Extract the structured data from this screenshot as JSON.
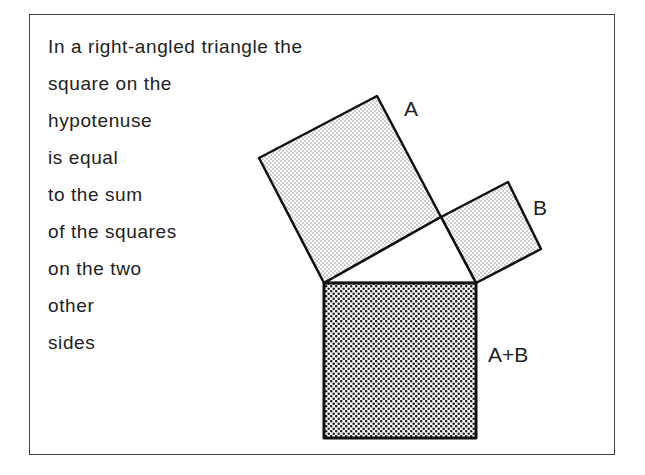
{
  "caption": {
    "lines": [
      "In a right-angled triangle the",
      "square on the",
      "hypotenuse",
      "is equal",
      "to the sum",
      "of the squares",
      "on the two",
      "other",
      "sides"
    ]
  },
  "labels": {
    "square_a": "A",
    "square_b": "B",
    "square_hyp": "A+B"
  },
  "colors": {
    "stroke": "#111111",
    "light_fill": "#d8d8d8",
    "dark_fill": "#5a5a5a",
    "background": "#ffffff"
  },
  "geometry": {
    "triangle": {
      "left": [
        324,
        283
      ],
      "apex": [
        441,
        217
      ],
      "right": [
        476,
        283
      ]
    },
    "square_a": [
      [
        324,
        283
      ],
      [
        259,
        158
      ],
      [
        377,
        96
      ],
      [
        441,
        217
      ]
    ],
    "square_b": [
      [
        441,
        217
      ],
      [
        508,
        182
      ],
      [
        541,
        249
      ],
      [
        476,
        283
      ]
    ],
    "square_hyp": [
      [
        324,
        283
      ],
      [
        476,
        283
      ],
      [
        476,
        438
      ],
      [
        324,
        438
      ]
    ]
  }
}
